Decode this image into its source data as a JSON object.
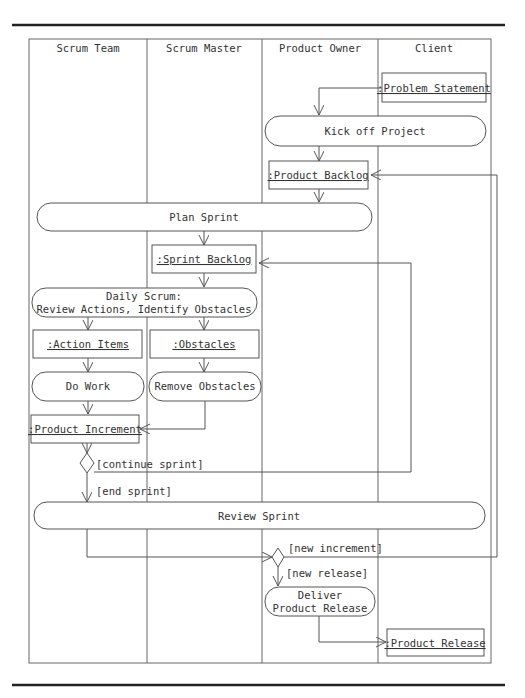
{
  "diagram": {
    "type": "UML activity diagram with swimlanes",
    "lanes": [
      {
        "label": "Scrum Team"
      },
      {
        "label": "Scrum Master"
      },
      {
        "label": "Product Owner"
      },
      {
        "label": "Client"
      }
    ],
    "objects": {
      "problem_statement": ":Problem Statement",
      "product_backlog": ":Product Backlog",
      "sprint_backlog": ":Sprint Backlog",
      "action_items": ":Action Items",
      "obstacles": ":Obstacles",
      "product_increment": ":Product Increment",
      "product_release": ":Product Release"
    },
    "activities": {
      "kick_off": "Kick off Project",
      "plan_sprint": "Plan Sprint",
      "daily_scrum_line1": "Daily Scrum:",
      "daily_scrum_line2": "Review Actions, Identify Obstacles",
      "do_work": "Do Work",
      "remove_obstacles": "Remove Obstacles",
      "review_sprint": "Review Sprint",
      "deliver_line1": "Deliver",
      "deliver_line2": "Product Release"
    },
    "guards": {
      "continue_sprint": "[continue sprint]",
      "end_sprint": "[end sprint]",
      "new_increment": "[new increment]",
      "new_release": "[new release]"
    }
  }
}
